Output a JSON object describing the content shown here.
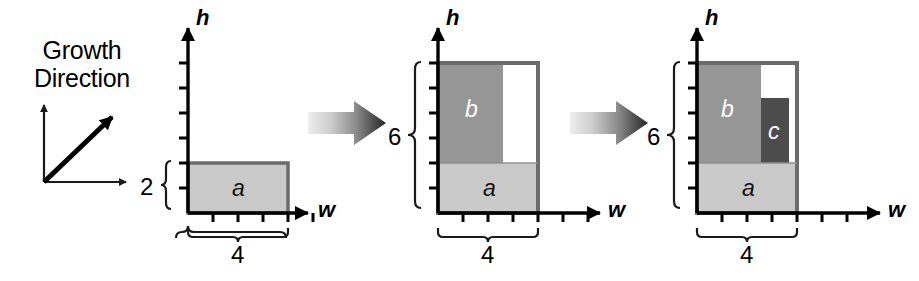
{
  "figure": {
    "background_color": "#ffffff",
    "legend": {
      "line1": "Growth",
      "line2": "Direction",
      "icon": "growth-direction-arrow"
    },
    "axis_labels": {
      "horizontal": "w",
      "vertical": "h"
    },
    "colors": {
      "region_a": "#c9c9c9",
      "region_b": "#969696",
      "region_c": "#4c4c4c",
      "empty": "#ffffff",
      "outline": "#6b6b6b",
      "axis": "#000000",
      "arrow_light": "#e2e2e2",
      "arrow_dark": "#2b2b2b"
    },
    "unit_px": 25,
    "panels": [
      {
        "id": "panel-1",
        "name": "step-1",
        "origin": {
          "x": 188,
          "y": 213
        },
        "axis": {
          "w_ticks": 6,
          "h_ticks": 6,
          "w_length_px": 120,
          "h_length_px": 190
        },
        "width_brace": {
          "label": "4",
          "units": 4
        },
        "height_brace": {
          "label": "2",
          "units": 2
        },
        "regions": [
          {
            "letter": "a",
            "x": 0,
            "y": 0,
            "w": 4,
            "h": 2,
            "fill": "region_a",
            "text_color": "light-bg"
          }
        ]
      },
      {
        "id": "panel-2",
        "name": "step-2",
        "origin": {
          "x": 438,
          "y": 213
        },
        "axis": {
          "w_ticks": 6,
          "h_ticks": 6,
          "w_length_px": 120,
          "h_length_px": 190
        },
        "width_brace": {
          "label": "4",
          "units": 4
        },
        "height_brace": {
          "label": "6",
          "units": 6
        },
        "outer_box": {
          "w": 4,
          "h": 6
        },
        "regions": [
          {
            "letter": "a",
            "x": 0,
            "y": 0,
            "w": 4,
            "h": 2,
            "fill": "region_a",
            "text_color": "light-bg"
          },
          {
            "letter": "b",
            "x": 0,
            "y": 2,
            "w": 2.6,
            "h": 4,
            "fill": "region_b",
            "text_color": "dark-bg"
          },
          {
            "letter": "",
            "x": 2.6,
            "y": 2,
            "w": 1.4,
            "h": 4,
            "fill": "empty",
            "text_color": "light-bg"
          }
        ]
      },
      {
        "id": "panel-3",
        "name": "step-3",
        "origin": {
          "x": 697,
          "y": 213
        },
        "axis": {
          "w_ticks": 6,
          "h_ticks": 6,
          "w_length_px": 120,
          "h_length_px": 190
        },
        "width_brace": {
          "label": "4",
          "units": 4
        },
        "height_brace": {
          "label": "6",
          "units": 6
        },
        "outer_box": {
          "w": 4,
          "h": 6
        },
        "regions": [
          {
            "letter": "a",
            "x": 0,
            "y": 0,
            "w": 4,
            "h": 2,
            "fill": "region_a",
            "text_color": "light-bg"
          },
          {
            "letter": "b",
            "x": 0,
            "y": 2,
            "w": 2.55,
            "h": 4,
            "fill": "region_b",
            "text_color": "dark-bg"
          },
          {
            "letter": "",
            "x": 2.55,
            "y": 2,
            "w": 1.45,
            "h": 4,
            "fill": "empty",
            "text_color": "light-bg"
          },
          {
            "letter": "c",
            "x": 2.55,
            "y": 2,
            "w": 1.1,
            "h": 2.6,
            "fill": "region_c",
            "text_color": "dark-bg"
          }
        ]
      }
    ],
    "transition_arrows": [
      {
        "id": "arrow-1-2",
        "x": 308,
        "y": 103,
        "width": 78,
        "height": 40
      },
      {
        "id": "arrow-2-3",
        "x": 570,
        "y": 103,
        "width": 78,
        "height": 40
      }
    ]
  }
}
